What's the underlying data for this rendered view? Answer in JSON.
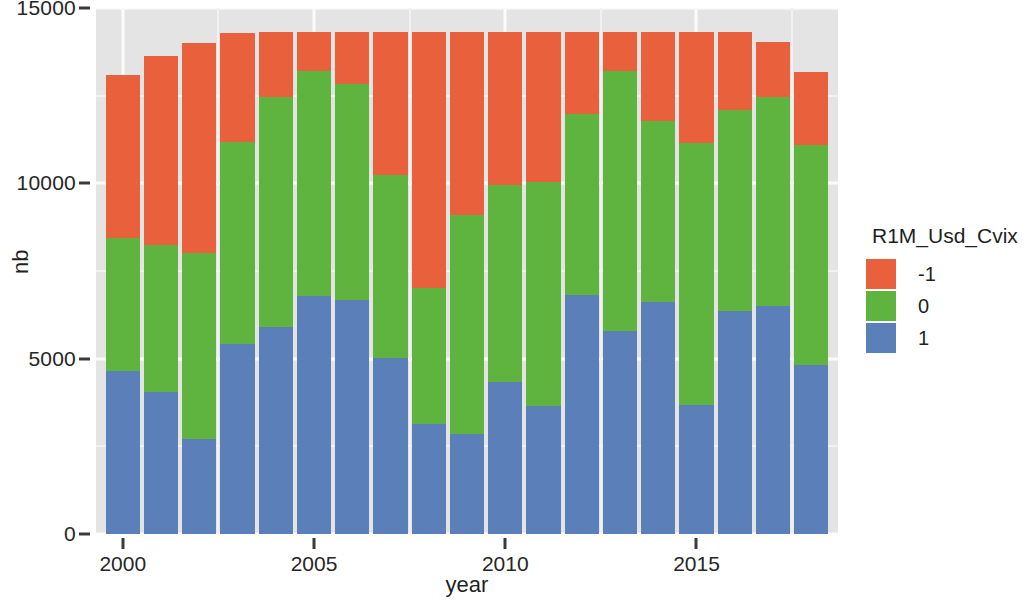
{
  "chart_data": {
    "type": "bar",
    "stacked": true,
    "title": "",
    "xlabel": "year",
    "ylabel": "nb",
    "xlim": [
      1999.3,
      2018.7
    ],
    "ylim": [
      0,
      15000
    ],
    "x_ticks": [
      2000,
      2005,
      2010,
      2015
    ],
    "x_tick_labels": [
      "2000",
      "2005",
      "2010",
      "2015"
    ],
    "y_ticks": [
      0,
      5000,
      10000,
      15000
    ],
    "y_tick_labels": [
      "0",
      "5000",
      "10000",
      "15000"
    ],
    "y_minor_ticks": [
      2500,
      7500,
      12500
    ],
    "grid": true,
    "legend": {
      "title": "R1M_Usd_Cvix",
      "position": "right",
      "entries": [
        {
          "label": "-1",
          "color": "#E8603C"
        },
        {
          "label": "0",
          "color": "#5FB440"
        },
        {
          "label": "1",
          "color": "#5B7FB8"
        }
      ]
    },
    "categories": [
      2000,
      2001,
      2002,
      2003,
      2004,
      2005,
      2006,
      2007,
      2008,
      2009,
      2010,
      2011,
      2012,
      2013,
      2014,
      2015,
      2016,
      2017,
      2018
    ],
    "stack_order": [
      "1",
      "0",
      "-1"
    ],
    "series": [
      {
        "name": "1",
        "color": "#5B7FB8",
        "values": [
          4660,
          4060,
          2700,
          5430,
          5890,
          6780,
          6680,
          5030,
          3130,
          2840,
          4340,
          3650,
          6810,
          5800,
          6610,
          3680,
          6350,
          6500,
          4830
        ]
      },
      {
        "name": "0",
        "color": "#5FB440",
        "values": [
          3790,
          4190,
          5320,
          5750,
          6580,
          6410,
          6140,
          5200,
          3880,
          6270,
          5600,
          6380,
          5170,
          7390,
          5170,
          7470,
          5750,
          5970,
          6260
        ]
      },
      {
        "name": "-1",
        "color": "#E8603C",
        "values": [
          4630,
          5370,
          5980,
          3100,
          1840,
          1120,
          1490,
          4080,
          7300,
          5200,
          4370,
          4280,
          2330,
          1120,
          2530,
          3160,
          2210,
          1560,
          2080
        ]
      }
    ],
    "stack_totals": [
      13080,
      13620,
      14000,
      14280,
      14310,
      14310,
      14310,
      14310,
      14310,
      14310,
      14310,
      14310,
      14310,
      14310,
      14310,
      14310,
      14310,
      14030,
      13170
    ],
    "cumulative_tops": {
      "blue": [
        4660,
        4060,
        2700,
        5430,
        5890,
        6780,
        6680,
        5030,
        3130,
        2840,
        4340,
        3650,
        6810,
        5800,
        6610,
        3680,
        6350,
        6500,
        4830
      ],
      "blue_plus_green": [
        8450,
        8250,
        8020,
        11180,
        12470,
        13190,
        12820,
        10230,
        7010,
        9110,
        9940,
        10030,
        11980,
        13190,
        11780,
        11150,
        12100,
        12470,
        11090
      ],
      "total": [
        13080,
        13620,
        14000,
        14280,
        14310,
        14310,
        14310,
        14310,
        14310,
        14310,
        14310,
        14310,
        14310,
        14310,
        14310,
        14310,
        14310,
        14030,
        13170
      ]
    }
  }
}
